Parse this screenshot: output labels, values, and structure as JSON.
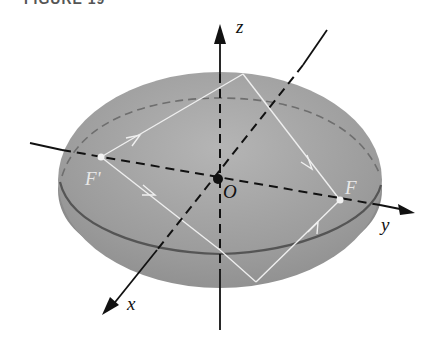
{
  "figure": {
    "title": "FIGURE 19",
    "caption_description": "Ellipsoid with foci F and F' on the y-axis, light ray reflecting off surface"
  },
  "axes": {
    "z_label": "z",
    "y_label": "y",
    "x_label": "x",
    "origin_label": "O"
  },
  "foci": {
    "left_label": "F'",
    "right_label": "F"
  },
  "colors": {
    "ellipsoid_fill": "#9a9a9a",
    "ellipsoid_band": "#8a8a8a",
    "ray": "#efefef",
    "axis": "#111111"
  }
}
